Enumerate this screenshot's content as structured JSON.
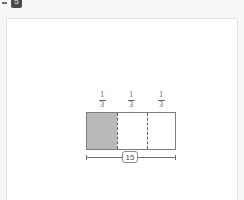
{
  "badge": {
    "label": "5",
    "icon": "question-number-badge",
    "color": "#4a4a4a"
  },
  "card": {
    "background": "#ffffff",
    "border_color": "#e3e3e3"
  },
  "diagram": {
    "type": "fraction-bar-model",
    "total_label": "15",
    "segment_count": 3,
    "shaded_count": 1,
    "shaded_color": "#b9b9b9",
    "outline_color": "#7d7d7d",
    "divider_style": "dashed",
    "segments": [
      {
        "numerator": "1",
        "denominator": "3",
        "shaded": true
      },
      {
        "numerator": "1",
        "denominator": "3",
        "shaded": false
      },
      {
        "numerator": "1",
        "denominator": "3",
        "shaded": false
      }
    ],
    "dimension": {
      "value": "15",
      "position": "below",
      "style": "double-ended-measure-line"
    }
  }
}
